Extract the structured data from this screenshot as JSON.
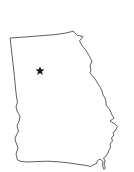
{
  "canvas": {
    "width": 134,
    "height": 172,
    "background_color": "#ffffff"
  },
  "map": {
    "viewbox": "0 0 134 172",
    "outline_color": "#4d4d4d",
    "outline_width": 0.9,
    "fill_color": "#ffffff",
    "outline_points": "10.5,38 25,37 40,35.8 55,34.6 65,33.2 73.5,31.2 77,35.2 83,36.5 79.5,41 82,45.5 86,50.5 89,55.5 92,61 90,66 91,70 90,73 95,79 97,82 100,87 102,91 103,95 105,98 106,101 106,105 110,110 112,115 114,118 110,121 115,124 117.5,127 115,131 113,132.5 114,135 111.5,138 112.5,141 110,144 110.5,147.5 109,150 108,153 106,156 103.5,158 105,161 104,165 105.5,168 104,169.5 102.5,165.5 103,161.5 100,159 97.5,160.5 96.5,163.5 94,164.5 90.5,166.5 85,165.2 80,164.6 73,163.6 68,162.8 58,161.8 48,161.2 38,161.5 28,162 21,161.5 17.5,160 16,154 18,148 15.5,141 15,138 18.5,131 17,126 19.5,120 20,116 17,111 16,107 17.5,102 16.5,97 15.5,88 14,72 12,55",
    "marker": {
      "shape": "star",
      "cx": 40,
      "cy": 71,
      "outer_radius": 4.8,
      "inner_ratio": 0.42,
      "color": "#1a1a1a"
    },
    "speckles": [
      {
        "x": 62,
        "y": 65,
        "r": 1.0,
        "color": "#dcdcdc"
      },
      {
        "x": 93,
        "y": 63,
        "r": 0.8,
        "color": "#e3e3e3"
      },
      {
        "x": 52,
        "y": 99.5,
        "r": 0.8,
        "color": "#e0e0e0"
      },
      {
        "x": 53,
        "y": 101.5,
        "r": 1.2,
        "color": "#cfcfcf"
      },
      {
        "x": 22,
        "y": 107,
        "r": 0.8,
        "color": "#e0e0e0"
      },
      {
        "x": 39,
        "y": 131,
        "r": 0.8,
        "color": "#e3e3e3"
      },
      {
        "x": 40,
        "y": 133,
        "r": 1.1,
        "color": "#d6d6d6"
      },
      {
        "x": 60,
        "y": 157,
        "r": 1.0,
        "color": "#dadada"
      },
      {
        "x": 52.5,
        "y": 158,
        "r": 0.7,
        "color": "#e3e3e3"
      }
    ]
  }
}
